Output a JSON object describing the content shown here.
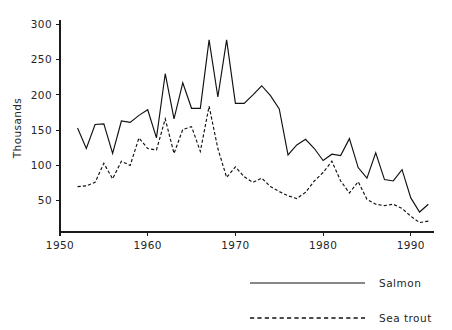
{
  "chart_data": {
    "type": "line",
    "title": "",
    "subtitle": "",
    "xlabel": "",
    "ylabel": "Thousands",
    "xlim": [
      1950,
      1992.6
    ],
    "ylim": [
      0,
      300
    ],
    "grid": false,
    "legend_position": "bottom-right",
    "xticks": [
      1950,
      1960,
      1970,
      1980,
      1990
    ],
    "xtick_labels": [
      "1950",
      "1960",
      "1970",
      "1980",
      "1990"
    ],
    "yticks": [
      50,
      100,
      150,
      200,
      250,
      300
    ],
    "ytick_labels": [
      "50",
      "100",
      "150",
      "200",
      "250",
      "300"
    ],
    "x": [
      1952,
      1953,
      1954,
      1955,
      1956,
      1957,
      1958,
      1959,
      1960,
      1961,
      1962,
      1963,
      1964,
      1965,
      1966,
      1967,
      1968,
      1969,
      1970,
      1971,
      1972,
      1973,
      1974,
      1975,
      1976,
      1977,
      1978,
      1979,
      1980,
      1981,
      1982,
      1983,
      1984,
      1985,
      1986,
      1987,
      1988,
      1989,
      1990,
      1991,
      1992
    ],
    "series": [
      {
        "name": "Salmon",
        "style": "solid",
        "color": "#111111",
        "values": [
          153,
          124,
          158,
          159,
          117,
          163,
          161,
          171,
          179,
          139,
          230,
          166,
          217,
          181,
          181,
          278,
          197,
          278,
          188,
          188,
          200,
          213,
          199,
          180,
          115,
          129,
          137,
          124,
          107,
          116,
          114,
          138,
          97,
          82,
          118,
          80,
          78,
          94,
          54,
          34,
          45
        ]
      },
      {
        "name": "Sea trout",
        "style": "dashed",
        "color": "#111111",
        "values": [
          70,
          71,
          76,
          103,
          81,
          106,
          100,
          139,
          124,
          122,
          166,
          117,
          151,
          155,
          120,
          184,
          124,
          83,
          98,
          84,
          76,
          82,
          70,
          63,
          57,
          53,
          62,
          78,
          90,
          106,
          78,
          61,
          77,
          52,
          45,
          43,
          45,
          39,
          28,
          19,
          21
        ]
      }
    ]
  },
  "legend": {
    "items": [
      {
        "label": "Salmon",
        "style": "solid"
      },
      {
        "label": "Sea trout",
        "style": "dashed"
      }
    ]
  },
  "axes": {
    "ylabel": "Thousands"
  }
}
